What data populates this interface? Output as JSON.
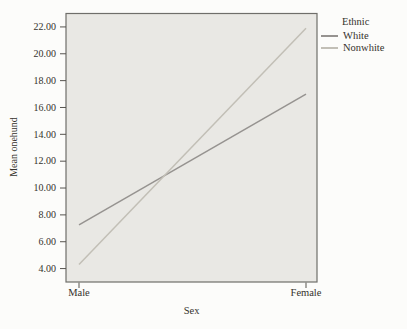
{
  "figure": {
    "paper_color": "#fcfcfa",
    "text_color": "#35322c"
  },
  "chart_data": {
    "type": "line",
    "title": "",
    "xlabel": "Sex",
    "ylabel": "Mean onehund",
    "categories": [
      "Male",
      "Female"
    ],
    "series": [
      {
        "name": "White",
        "values": [
          7.25,
          17.0
        ],
        "color": "#969390"
      },
      {
        "name": "Nonwhite",
        "values": [
          4.3,
          21.9
        ],
        "color": "#c2bfb6"
      }
    ],
    "ylim": [
      3,
      23
    ],
    "yticks": [
      4,
      6,
      8,
      10,
      12,
      14,
      16,
      18,
      20,
      22
    ],
    "ytick_labels": [
      "4.00",
      "6.00",
      "8.00",
      "10.00",
      "12.00",
      "14.00",
      "16.00",
      "18.00",
      "20.00",
      "22.00"
    ],
    "grid": false,
    "legend": {
      "title": "Ethnic",
      "position": "top-right-outside"
    },
    "plot_background": "#e9e8e4",
    "border_color": "#6f6e6a",
    "tick_color": "#56544f"
  }
}
